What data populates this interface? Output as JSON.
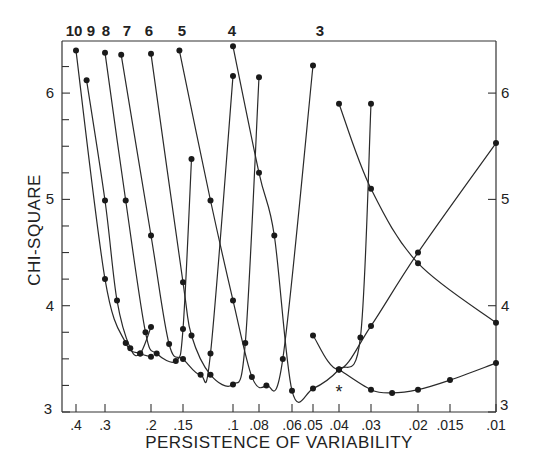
{
  "chart_data": {
    "type": "line",
    "title": "",
    "xlabel": "PERSISTENCE OF VARIABILITY",
    "ylabel": "CHI-SQUARE",
    "xscale": "log",
    "x_reversed": true,
    "xlim": [
      0.43,
      0.01
    ],
    "ylim": [
      3,
      6.5
    ],
    "grid": false,
    "legend": "curve labels at top (number of ... per curve)",
    "x_ticks": [
      0.4,
      0.3,
      0.2,
      0.15,
      0.1,
      0.08,
      0.06,
      0.05,
      0.04,
      0.03,
      0.02,
      0.015,
      0.01
    ],
    "x_tick_labels": [
      ".4",
      ".3",
      ".2",
      ".15",
      ".1",
      ".08",
      ".06",
      ".05",
      ".04",
      ".03",
      ".02",
      ".015",
      ".01"
    ],
    "y_ticks_left": [
      3,
      4,
      5,
      6
    ],
    "y_ticks_right": [
      3,
      4,
      5,
      6
    ],
    "y_minor_ticks": [
      3.25,
      3.5,
      3.75,
      4.25,
      4.5,
      4.75,
      5.25,
      5.5,
      5.75,
      6.25
    ],
    "series": [
      {
        "name": "10",
        "x": [
          0.4,
          0.3,
          0.25,
          0.22,
          0.2
        ],
        "y": [
          6.4,
          4.25,
          3.65,
          3.55,
          3.52
        ]
      },
      {
        "name": "9",
        "x": [
          0.36,
          0.3,
          0.27,
          0.24,
          0.22,
          0.2
        ],
        "y": [
          6.12,
          4.99,
          4.05,
          3.6,
          3.55,
          3.8
        ]
      },
      {
        "name": "8",
        "x": [
          0.3,
          0.25,
          0.21,
          0.19,
          0.16,
          0.15,
          0.14
        ],
        "y": [
          6.38,
          4.99,
          3.75,
          3.55,
          3.48,
          3.78,
          5.38
        ]
      },
      {
        "name": "7",
        "x": [
          0.26,
          0.2,
          0.17,
          0.15,
          0.13,
          0.12,
          0.1
        ],
        "y": [
          6.36,
          4.66,
          3.64,
          3.5,
          3.35,
          3.55,
          6.16
        ]
      },
      {
        "name": "6",
        "x": [
          0.2,
          0.15,
          0.14,
          0.12,
          0.1,
          0.09,
          0.08
        ],
        "y": [
          6.37,
          4.22,
          3.72,
          3.35,
          3.26,
          3.65,
          6.15
        ]
      },
      {
        "name": "5",
        "x": [
          0.155,
          0.12,
          0.1,
          0.085,
          0.075,
          0.065,
          0.05
        ],
        "y": [
          6.4,
          4.99,
          4.05,
          3.33,
          3.25,
          3.5,
          6.26
        ]
      },
      {
        "name": "4",
        "x": [
          0.1,
          0.08,
          0.07,
          0.06,
          0.05,
          0.04,
          0.033,
          0.03
        ],
        "y": [
          6.44,
          5.25,
          4.66,
          3.2,
          3.22,
          3.4,
          3.7,
          5.9
        ]
      },
      {
        "name": "3",
        "x": [
          0.04,
          0.03,
          0.02,
          0.01
        ],
        "y": [
          5.9,
          5.1,
          4.4,
          3.84
        ]
      },
      {
        "name": "2 (right-rising)",
        "x": [
          0.05,
          0.04,
          0.03,
          0.02,
          0.01
        ],
        "y": [
          3.72,
          3.4,
          3.81,
          4.5,
          5.53
        ]
      },
      {
        "name": "1 (bottom)",
        "x": [
          0.04,
          0.03,
          0.025,
          0.02,
          0.015,
          0.01
        ],
        "y": [
          3.4,
          3.21,
          3.18,
          3.21,
          3.3,
          3.46
        ]
      }
    ],
    "annotations": [
      {
        "type": "asterisk",
        "x": 0.04,
        "y": 3.2,
        "text": "*"
      }
    ],
    "curve_top_labels": [
      "10",
      "9",
      "8",
      "7",
      "6",
      "5",
      "4",
      "3"
    ]
  }
}
